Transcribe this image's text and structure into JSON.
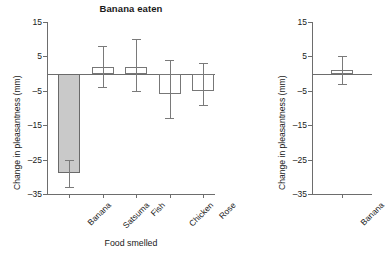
{
  "figure": {
    "panels": [
      {
        "key": "left",
        "title": "Banana eaten",
        "ylabel": "Change in pleasantness (mm)",
        "xlabel": "Food smelled"
      },
      {
        "key": "right",
        "title": "",
        "ylabel": "Change in pleasantness (mm)",
        "xlabel": ""
      }
    ]
  },
  "chart_data": [
    {
      "type": "bar",
      "title": "Banana eaten",
      "xlabel": "Food smelled",
      "ylabel": "Change in pleasantness (mm)",
      "categories": [
        "Banana",
        "Satsuma",
        "Fish",
        "Chicken",
        "Rose"
      ],
      "values": [
        -29,
        2,
        2,
        -6,
        -5
      ],
      "error_low": [
        -33,
        -4,
        -5,
        -13,
        -9
      ],
      "error_high": [
        -25,
        8,
        10,
        4,
        3
      ],
      "fills": [
        "gray",
        "open",
        "open",
        "open",
        "open"
      ],
      "ylim": [
        -35,
        15
      ],
      "yticks": [
        15,
        5,
        -5,
        -15,
        -25,
        -35
      ],
      "ytick_labels": [
        "15",
        "5",
        "–5",
        "–15",
        "–25",
        "–35"
      ],
      "zero_line": 0,
      "grid": false,
      "legend": "none",
      "error_type": "error bars"
    },
    {
      "type": "bar",
      "title": "",
      "xlabel": "",
      "ylabel": "Change in pleasantness (mm)",
      "categories": [
        "Banana"
      ],
      "values": [
        1
      ],
      "error_low": [
        -3
      ],
      "error_high": [
        5
      ],
      "fills": [
        "open"
      ],
      "ylim": [
        -35,
        15
      ],
      "yticks": [
        15,
        5,
        -5,
        -15,
        -25,
        -35
      ],
      "ytick_labels": [
        "15",
        "5",
        "–5",
        "–15",
        "–25",
        "–35"
      ],
      "zero_line": 0,
      "grid": false,
      "legend": "none",
      "error_type": "error bars",
      "note": "bar is clipped by the right edge of the image"
    }
  ]
}
